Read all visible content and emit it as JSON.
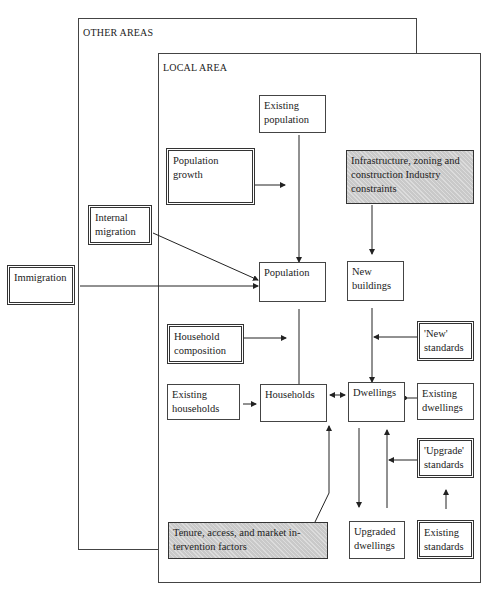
{
  "diagram": {
    "regions": {
      "other_areas": "OTHER AREAS",
      "local_area": "LOCAL AREA"
    },
    "nodes": {
      "existing_population": "Existing population",
      "population_growth": "Population growth",
      "infrastructure": "Infrastructure, zoning and construction Industry constraints",
      "internal_migration": "Internal migration",
      "immigration": "Immigration",
      "population": "Population",
      "new_buildings": "New buildings",
      "household_composition": "Household composition",
      "new_standards": "'New' standards",
      "existing_households": "Existing households",
      "households": "Households",
      "dwellings": "Dwellings",
      "existing_dwellings": "Existing dwellings",
      "upgrade_standards": "'Upgrade' standards",
      "tenure_factors": "Tenure, access, and market in-tervention factors",
      "upgraded_dwellings": "Upgraded dwellings",
      "existing_standards": "Existing standards"
    },
    "edges": [
      {
        "from": "existing_population",
        "to": "population"
      },
      {
        "from": "population_growth",
        "to": "population"
      },
      {
        "from": "internal_migration",
        "to": "population"
      },
      {
        "from": "immigration",
        "to": "population"
      },
      {
        "from": "infrastructure",
        "to": "new_buildings"
      },
      {
        "from": "population",
        "to": "households"
      },
      {
        "from": "household_composition",
        "to": "households"
      },
      {
        "from": "existing_households",
        "to": "households"
      },
      {
        "from": "households",
        "to": "dwellings",
        "bidirectional": true
      },
      {
        "from": "new_buildings",
        "to": "dwellings"
      },
      {
        "from": "new_standards",
        "to": "dwellings"
      },
      {
        "from": "existing_dwellings",
        "to": "dwellings"
      },
      {
        "from": "dwellings",
        "to": "upgraded_dwellings"
      },
      {
        "from": "upgraded_dwellings",
        "to": "dwellings"
      },
      {
        "from": "upgrade_standards",
        "to": "dwellings"
      },
      {
        "from": "existing_standards",
        "to": "upgrade_standards"
      },
      {
        "from": "tenure_factors",
        "to": "households"
      }
    ]
  }
}
